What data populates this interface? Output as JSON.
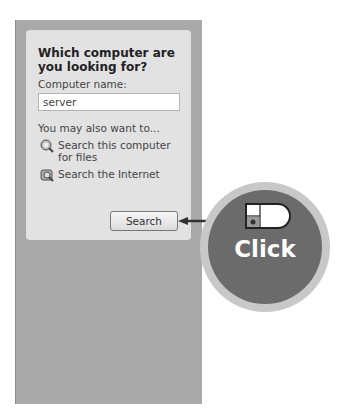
{
  "panel": {
    "title": "Which computer are you looking for?",
    "computer_name_label": "Computer name:",
    "computer_name_value": "server",
    "also_label": "You may also want to...",
    "links": [
      {
        "label": "Search this computer for files",
        "icon": "search-computer-icon"
      },
      {
        "label": "Search the Internet",
        "icon": "search-internet-icon"
      }
    ],
    "search_button": "Search"
  },
  "callout": {
    "label": "Click",
    "icon": "mouse-left-click-icon"
  }
}
